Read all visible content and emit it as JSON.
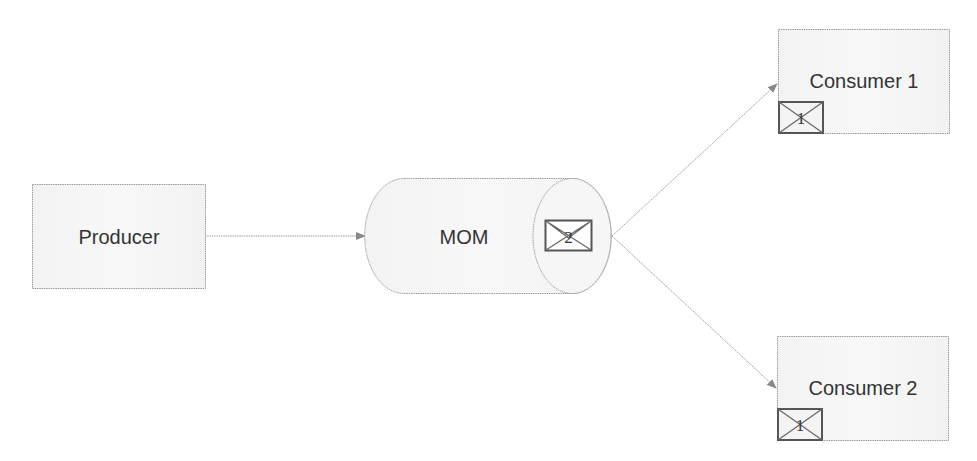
{
  "diagram": {
    "nodes": {
      "producer": {
        "label": "Producer"
      },
      "mom": {
        "label": "MOM",
        "queued_message": "2"
      },
      "consumer1": {
        "label": "Consumer 1",
        "message": "1"
      },
      "consumer2": {
        "label": "Consumer 2",
        "message": "1"
      }
    },
    "edges": [
      {
        "from": "Producer",
        "to": "MOM"
      },
      {
        "from": "MOM",
        "to": "Consumer 1"
      },
      {
        "from": "MOM",
        "to": "Consumer 2"
      }
    ],
    "colors": {
      "box_fill": "#f4f4f4",
      "border": "#9a9a9a",
      "arrow": "#999999",
      "text": "#333333",
      "envelope": "#555555"
    }
  }
}
